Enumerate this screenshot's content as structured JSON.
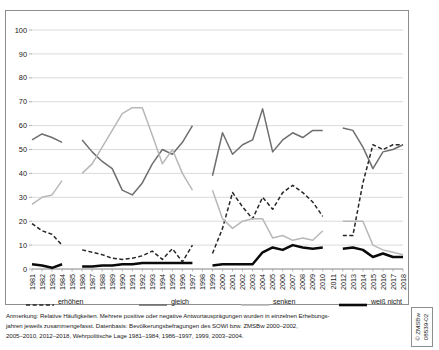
{
  "chart_data": {
    "type": "line",
    "title": "",
    "xlabel": "",
    "ylabel": "",
    "ylim": [
      0,
      100
    ],
    "ytick_step": 10,
    "grid": "horizontal",
    "legend_position": "below-plot",
    "yticks": [
      "0",
      "10",
      "20",
      "30",
      "40",
      "50",
      "60",
      "70",
      "80",
      "90",
      "100"
    ],
    "categories": [
      "1981",
      "1982",
      "1983",
      "1984",
      "1985",
      "1986",
      "1987",
      "1988",
      "1989",
      "1990",
      "1991",
      "1992",
      "1993",
      "1994",
      "1995",
      "1996",
      "1997",
      "1998",
      "1999",
      "2000",
      "2001",
      "2002",
      "2003",
      "2004",
      "2005",
      "2006",
      "2007",
      "2008",
      "2009",
      "2010",
      "2011",
      "2012",
      "2013",
      "2014",
      "2015",
      "2016",
      "2017",
      "2018"
    ],
    "series": [
      {
        "name": "erhöhen",
        "style": "dashed",
        "color": "#262626",
        "width": 1.5,
        "values": [
          19,
          16,
          14.5,
          10,
          null,
          8,
          7,
          6,
          4.5,
          4,
          4.5,
          5.5,
          7.5,
          4,
          8.5,
          3,
          10,
          null,
          6.5,
          17,
          32,
          26,
          21,
          30,
          25,
          32,
          35,
          32,
          28,
          22,
          null,
          14,
          14,
          36,
          52,
          50,
          52,
          52
        ]
      },
      {
        "name": "gleich",
        "style": "solid",
        "color": "#6e6e6e",
        "width": 1.5,
        "values": [
          54,
          56.5,
          55,
          53,
          null,
          54,
          49,
          45,
          42,
          33,
          31,
          36,
          44,
          50,
          48,
          53,
          60,
          null,
          39,
          57,
          48,
          52,
          54,
          67,
          49,
          54,
          57,
          55,
          58,
          58,
          null,
          59,
          58,
          51,
          42,
          49,
          50,
          52
        ]
      },
      {
        "name": "senken",
        "style": "solid",
        "color": "#b8b8b8",
        "width": 1.5,
        "values": [
          27,
          30,
          31,
          37,
          null,
          40,
          44,
          51,
          58,
          65,
          67.5,
          67.5,
          56,
          44,
          50,
          40,
          33,
          null,
          33,
          21,
          17,
          20,
          21,
          21,
          13,
          14,
          12,
          13,
          12,
          16,
          null,
          20,
          20,
          20,
          10,
          8,
          7,
          6
        ]
      },
      {
        "name": "weiß nicht",
        "style": "solid",
        "color": "#0a0a0a",
        "width": 2.5,
        "values": [
          2,
          1.5,
          0.5,
          2,
          null,
          1,
          1,
          1.5,
          1.5,
          2,
          2,
          2.5,
          2.5,
          2.5,
          2.5,
          2.5,
          2.5,
          null,
          1.5,
          2,
          2,
          2,
          2,
          7,
          9,
          8,
          10,
          9,
          8.5,
          9,
          null,
          8.5,
          9,
          8,
          5,
          6.5,
          5,
          5
        ]
      }
    ]
  },
  "legend": {
    "entries": [
      {
        "label": "erhöhen",
        "style": "dashed",
        "color": "#262626",
        "x": 0
      },
      {
        "label": "gleich",
        "style": "solid",
        "color": "#6e6e6e",
        "x": 113
      },
      {
        "label": "senken",
        "style": "solid",
        "color": "#b8b8b8",
        "x": 215
      },
      {
        "label": "weiß nicht",
        "style": "thick",
        "color": "#0a0a0a",
        "x": 313
      }
    ]
  },
  "footnote": {
    "lines": [
      "Anmerkung: Relative Häufigkeiten. Mehrere positive oder negative Antwortausprägungen wurden in einzelnen Erhebungs-",
      "jahren jeweils zusammengefasst. Datenbasis: Bevölkerungsbefragungen des SOWI bzw. ZMSBw 2000–2002,",
      "2005–2010, 2012–2018, Wehrpolitische Lage 1981–1984, 1986–1997, 1999, 2003–2004."
    ]
  },
  "credit": {
    "line1": "© ZMSBw",
    "line2": "08539-02"
  }
}
